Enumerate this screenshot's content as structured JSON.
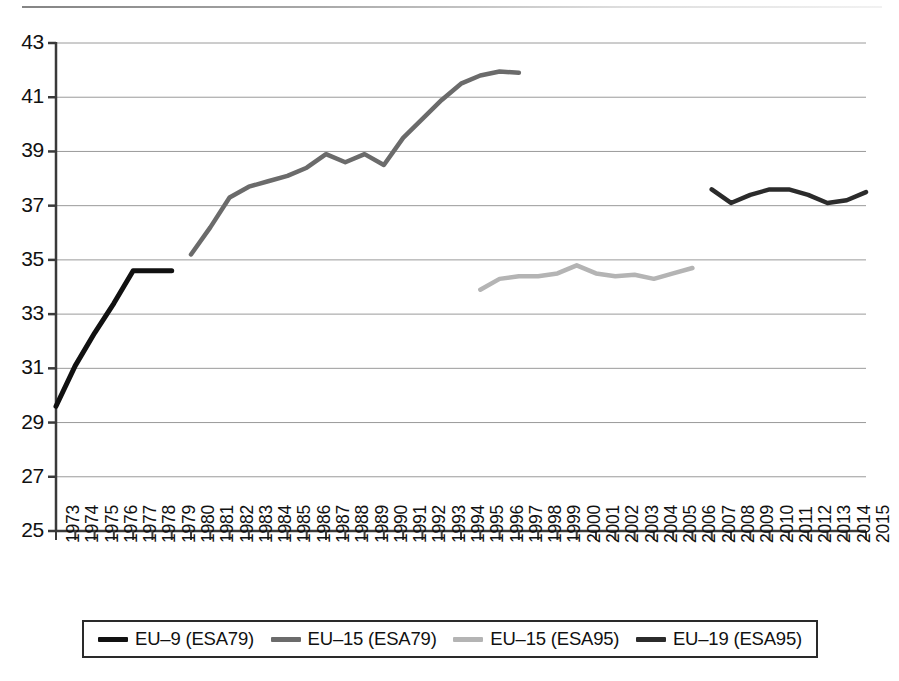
{
  "chart_data": {
    "type": "line",
    "title": "",
    "subtitle": "",
    "xlabel": "",
    "ylabel": "",
    "xlim": [
      1973,
      2015
    ],
    "ylim": [
      25,
      43
    ],
    "yticks": [
      25,
      27,
      29,
      31,
      33,
      35,
      37,
      39,
      41,
      43
    ],
    "ytick_labels": [
      "25",
      "27",
      "29",
      "31",
      "33",
      "35",
      "37",
      "39",
      "41",
      "43"
    ],
    "x": [
      1973,
      1974,
      1975,
      1976,
      1977,
      1978,
      1979,
      1980,
      1981,
      1982,
      1983,
      1984,
      1985,
      1986,
      1987,
      1988,
      1989,
      1990,
      1991,
      1992,
      1993,
      1994,
      1995,
      1996,
      1997,
      1998,
      1999,
      2000,
      2001,
      2002,
      2003,
      2004,
      2005,
      2006,
      2007,
      2008,
      2009,
      2010,
      2011,
      2012,
      2013,
      2014,
      2015
    ],
    "xtick_labels": [
      "1973",
      "1974",
      "1975",
      "1976",
      "1977",
      "1978",
      "1979",
      "1980",
      "1981",
      "1982",
      "1983",
      "1984",
      "1985",
      "1986",
      "1987",
      "1988",
      "1989",
      "1990",
      "1991",
      "1992",
      "1993",
      "1994",
      "1995",
      "1996",
      "1997",
      "1998",
      "1999",
      "2000",
      "2001",
      "2002",
      "2003",
      "2004",
      "2005",
      "2006",
      "2007",
      "2008",
      "2009",
      "2010",
      "2011",
      "2012",
      "2013",
      "2014",
      "2015"
    ],
    "grid": true,
    "grid_axis": "y",
    "legend_position": "bottom",
    "series": [
      {
        "name": "EU–9 (ESA79)",
        "color": "#111111",
        "linewidth": 5,
        "x": [
          1973,
          1974,
          1975,
          1976,
          1977,
          1978,
          1979
        ],
        "values": [
          29.6,
          31.1,
          32.3,
          33.4,
          34.6,
          34.6,
          34.6
        ]
      },
      {
        "name": "EU–15 (ESA79)",
        "color": "#6b6b6b",
        "linewidth": 4.5,
        "x": [
          1980,
          1981,
          1982,
          1983,
          1984,
          1985,
          1986,
          1987,
          1988,
          1989,
          1990,
          1991,
          1992,
          1993,
          1994,
          1995,
          1996,
          1997
        ],
        "values": [
          35.2,
          36.2,
          37.3,
          37.7,
          37.9,
          38.1,
          38.4,
          38.9,
          38.6,
          38.9,
          38.5,
          39.5,
          40.2,
          40.9,
          41.5,
          41.8,
          41.95,
          41.9
        ]
      },
      {
        "name": "EU–15 (ESA95)",
        "color": "#b4b4b4",
        "linewidth": 4.5,
        "x": [
          1995,
          1996,
          1997,
          1998,
          1999,
          2000,
          2001,
          2002,
          2003,
          2004,
          2005,
          2006
        ],
        "values": [
          33.9,
          34.3,
          34.4,
          34.4,
          34.5,
          34.8,
          34.5,
          34.4,
          34.45,
          34.3,
          34.5,
          34.7
        ]
      },
      {
        "name": "EU–19 (ESA95)",
        "color": "#2b2b2b",
        "linewidth": 4.5,
        "x": [
          2007,
          2008,
          2009,
          2010,
          2011,
          2012,
          2013,
          2014,
          2015
        ],
        "values": [
          37.6,
          37.1,
          37.4,
          37.6,
          37.6,
          37.4,
          37.1,
          37.2,
          37.5
        ]
      }
    ]
  },
  "legend": {
    "items": [
      {
        "label": "EU–9 (ESA79)",
        "color": "#111111"
      },
      {
        "label": "EU–15 (ESA79)",
        "color": "#6b6b6b"
      },
      {
        "label": "EU–15 (ESA95)",
        "color": "#b4b4b4"
      },
      {
        "label": "EU–19 (ESA95)",
        "color": "#2b2b2b"
      }
    ]
  }
}
